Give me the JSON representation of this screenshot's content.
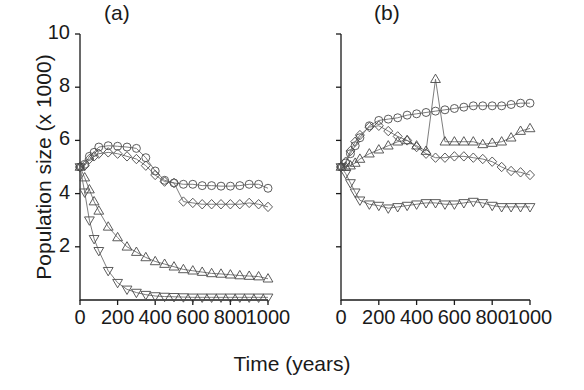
{
  "figure": {
    "ylabel": "Population size (x 1000)",
    "xlabel": "Time (years)",
    "panel_a_label": "(a)",
    "panel_b_label": "(b)",
    "y_ticks": [
      "10",
      "8",
      "6",
      "4",
      "2"
    ],
    "x_ticks": [
      "0",
      "200",
      "400",
      "600",
      "800",
      "1000"
    ],
    "line_color": "#6e6e6e",
    "marker_color": "#4a4a4a",
    "axis_color": "#1a1a1a"
  },
  "chart_data": [
    {
      "type": "line",
      "title": "(a)",
      "xlabel": "Time (years)",
      "ylabel": "Population size (x 1000)",
      "xlim": [
        0,
        1000
      ],
      "ylim": [
        0,
        10
      ],
      "x_ticks": [
        0,
        200,
        400,
        600,
        800,
        1000
      ],
      "y_ticks": [
        0,
        2,
        4,
        6,
        8,
        10
      ],
      "grid": false,
      "legend": "none",
      "x": [
        0,
        25,
        50,
        75,
        100,
        150,
        200,
        250,
        300,
        350,
        400,
        450,
        500,
        550,
        600,
        650,
        700,
        750,
        800,
        850,
        900,
        950,
        1000
      ],
      "series": [
        {
          "name": "circle",
          "marker": "circle",
          "values": [
            5.0,
            5.1,
            5.4,
            5.55,
            5.75,
            5.8,
            5.78,
            5.75,
            5.7,
            5.35,
            4.85,
            4.5,
            4.4,
            4.35,
            4.35,
            4.3,
            4.3,
            4.28,
            4.28,
            4.3,
            4.35,
            4.35,
            4.2
          ]
        },
        {
          "name": "diamond",
          "marker": "diamond",
          "values": [
            5.0,
            5.05,
            5.3,
            5.4,
            5.5,
            5.55,
            5.5,
            5.4,
            5.3,
            5.05,
            4.7,
            4.45,
            4.4,
            3.7,
            3.65,
            3.6,
            3.6,
            3.6,
            3.6,
            3.6,
            3.65,
            3.6,
            3.5
          ]
        },
        {
          "name": "triangle-up",
          "marker": "triangle-up",
          "values": [
            5.0,
            4.6,
            4.15,
            3.7,
            3.35,
            2.75,
            2.35,
            2.0,
            1.8,
            1.6,
            1.45,
            1.35,
            1.25,
            1.15,
            1.1,
            1.05,
            1.0,
            0.98,
            0.95,
            0.92,
            0.9,
            0.88,
            0.8
          ]
        },
        {
          "name": "triangle-down",
          "marker": "triangle-down",
          "values": [
            5.0,
            4.05,
            3.0,
            2.3,
            1.85,
            1.1,
            0.65,
            0.4,
            0.28,
            0.2,
            0.15,
            0.13,
            0.12,
            0.11,
            0.1,
            0.1,
            0.1,
            0.1,
            0.1,
            0.1,
            0.1,
            0.1,
            0.1
          ]
        }
      ]
    },
    {
      "type": "line",
      "title": "(b)",
      "xlabel": "Time (years)",
      "ylabel": "Population size (x 1000)",
      "xlim": [
        0,
        1000
      ],
      "ylim": [
        0,
        10
      ],
      "x_ticks": [
        0,
        200,
        400,
        600,
        800,
        1000
      ],
      "y_ticks": [
        0,
        2,
        4,
        6,
        8,
        10
      ],
      "grid": false,
      "legend": "none",
      "annotations": [
        "triangle-up series spikes to 8.3 at t=500"
      ],
      "x": [
        0,
        25,
        50,
        75,
        100,
        150,
        200,
        250,
        300,
        350,
        400,
        450,
        500,
        550,
        600,
        650,
        700,
        750,
        800,
        850,
        900,
        950,
        1000
      ],
      "series": [
        {
          "name": "circle",
          "marker": "circle",
          "values": [
            5.0,
            5.15,
            5.5,
            5.8,
            6.1,
            6.55,
            6.75,
            6.8,
            6.85,
            6.95,
            7.0,
            7.05,
            7.1,
            7.15,
            7.2,
            7.25,
            7.3,
            7.3,
            7.3,
            7.3,
            7.35,
            7.4,
            7.4
          ]
        },
        {
          "name": "diamond",
          "marker": "diamond",
          "values": [
            5.0,
            5.2,
            5.6,
            5.95,
            6.2,
            6.5,
            6.55,
            6.35,
            6.15,
            6.0,
            5.75,
            5.5,
            5.35,
            5.35,
            5.4,
            5.4,
            5.35,
            5.3,
            5.2,
            5.0,
            4.85,
            4.8,
            4.7
          ]
        },
        {
          "name": "triangle-up",
          "marker": "triangle-up",
          "values": [
            5.0,
            5.0,
            5.05,
            5.15,
            5.3,
            5.5,
            5.65,
            5.8,
            5.95,
            6.0,
            5.8,
            5.6,
            8.3,
            5.95,
            5.95,
            5.95,
            5.95,
            5.85,
            5.9,
            5.95,
            6.1,
            6.35,
            6.45
          ]
        },
        {
          "name": "triangle-down",
          "marker": "triangle-down",
          "values": [
            5.0,
            4.75,
            4.4,
            4.05,
            3.75,
            3.6,
            3.55,
            3.45,
            3.5,
            3.55,
            3.6,
            3.65,
            3.65,
            3.6,
            3.6,
            3.65,
            3.7,
            3.65,
            3.55,
            3.5,
            3.5,
            3.5,
            3.5
          ]
        }
      ]
    }
  ]
}
